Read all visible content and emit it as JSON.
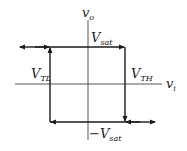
{
  "diagram": {
    "type": "hysteresis-loop",
    "axes": {
      "x": {
        "symbol": "v",
        "subscript": "i"
      },
      "y": {
        "symbol": "v",
        "subscript": "o"
      }
    },
    "labels": {
      "vsat_top": {
        "prefix": "",
        "symbol": "V",
        "subscript": "sat"
      },
      "vsat_bottom": {
        "prefix": "−",
        "symbol": "V",
        "subscript": "sat"
      },
      "vtl": {
        "symbol": "V",
        "subscript": "TL"
      },
      "vth": {
        "symbol": "V",
        "subscript": "TH"
      }
    },
    "colors": {
      "line": "#1a1a1a",
      "axis": "#444444",
      "background": "#ffffff"
    }
  }
}
